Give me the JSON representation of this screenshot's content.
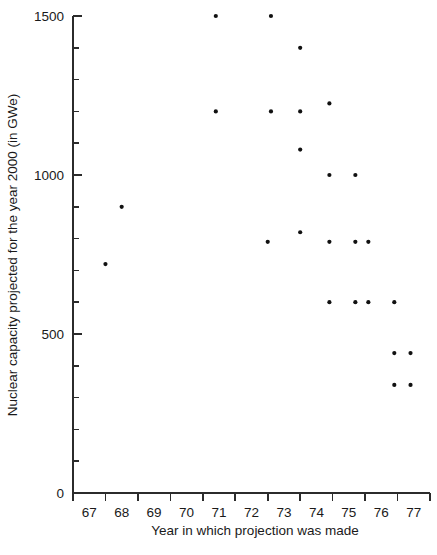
{
  "chart_data": {
    "type": "scatter",
    "title": "",
    "xlabel": "Year in which projection was made",
    "ylabel": "Nuclear capacity projected for the year 2000 (in GWe)",
    "xlim": [
      66.5,
      77.5
    ],
    "ylim": [
      0,
      1500
    ],
    "grid": false,
    "legend": null,
    "x_tick_labels": [
      "67",
      "68",
      "69",
      "70",
      "71",
      "72",
      "73",
      "74",
      "75",
      "76",
      "77"
    ],
    "y_tick_labels": [
      "0",
      "500",
      "1000",
      "1500"
    ],
    "y_major_ticks": [
      0,
      500,
      1000,
      1500
    ],
    "y_minor_tick_interval": 100,
    "x_tick_label_position": "between-ticks",
    "point_color": "#111111",
    "axis_color": "#2b2b2b",
    "points": [
      {
        "x": 67.5,
        "y": 720
      },
      {
        "x": 68.0,
        "y": 900
      },
      {
        "x": 70.9,
        "y": 1500
      },
      {
        "x": 70.9,
        "y": 1200
      },
      {
        "x": 72.6,
        "y": 1500
      },
      {
        "x": 72.6,
        "y": 1200
      },
      {
        "x": 72.5,
        "y": 790
      },
      {
        "x": 73.5,
        "y": 1400
      },
      {
        "x": 73.5,
        "y": 1200
      },
      {
        "x": 73.5,
        "y": 1080
      },
      {
        "x": 73.5,
        "y": 820
      },
      {
        "x": 74.4,
        "y": 1225
      },
      {
        "x": 74.4,
        "y": 1000
      },
      {
        "x": 74.4,
        "y": 790
      },
      {
        "x": 74.4,
        "y": 600
      },
      {
        "x": 75.2,
        "y": 1000
      },
      {
        "x": 75.2,
        "y": 790
      },
      {
        "x": 75.2,
        "y": 600
      },
      {
        "x": 75.6,
        "y": 790
      },
      {
        "x": 75.6,
        "y": 600
      },
      {
        "x": 76.4,
        "y": 600
      },
      {
        "x": 76.4,
        "y": 440
      },
      {
        "x": 76.4,
        "y": 340
      },
      {
        "x": 76.9,
        "y": 440
      },
      {
        "x": 76.9,
        "y": 340
      }
    ]
  }
}
